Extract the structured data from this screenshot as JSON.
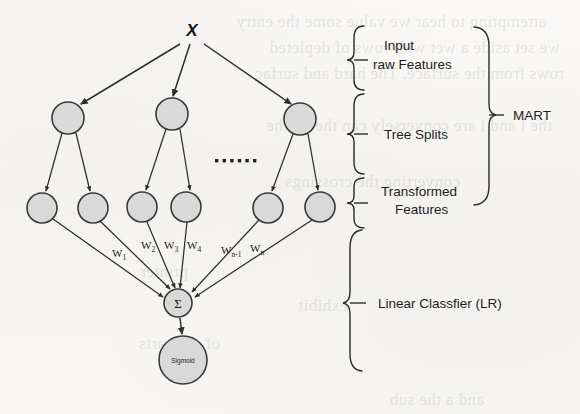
{
  "figure": {
    "input_label": "X",
    "sum_node_label": "Σ",
    "output_node_label": "Sigmoid",
    "ellipsis_dot_count": 6
  },
  "annotations": {
    "input_raw_features_line1": "Input",
    "input_raw_features_line2": "raw Features",
    "tree_splits": "Tree Splits",
    "transformed_line1": "Transformed",
    "transformed_line2": "Features",
    "mart": "MART",
    "linear_classifier": "Linear Classfier (LR)"
  },
  "weights": [
    {
      "name": "W",
      "sub": "1",
      "x": 112,
      "y": 257
    },
    {
      "name": "W",
      "sub": "2",
      "x": 141,
      "y": 249
    },
    {
      "name": "W",
      "sub": "3",
      "x": 164,
      "y": 249
    },
    {
      "name": "W",
      "sub": "4",
      "x": 187,
      "y": 249
    },
    {
      "name": "W",
      "sub": "n-1",
      "x": 221,
      "y": 254
    },
    {
      "name": "W",
      "sub": "n",
      "x": 250,
      "y": 252
    }
  ],
  "nodes": {
    "splits": [
      {
        "id": "s1",
        "cx": 68,
        "cy": 118,
        "r": 16
      },
      {
        "id": "s2",
        "cx": 172,
        "cy": 114,
        "r": 16
      },
      {
        "id": "s3",
        "cx": 300,
        "cy": 119,
        "r": 16
      }
    ],
    "leaves": [
      {
        "id": "l1",
        "cx": 42,
        "cy": 208,
        "r": 15
      },
      {
        "id": "l2",
        "cx": 93,
        "cy": 208,
        "r": 15
      },
      {
        "id": "l3",
        "cx": 142,
        "cy": 207,
        "r": 15
      },
      {
        "id": "l4",
        "cx": 186,
        "cy": 207,
        "r": 15
      },
      {
        "id": "l5",
        "cx": 268,
        "cy": 208,
        "r": 15
      },
      {
        "id": "l6",
        "cx": 320,
        "cy": 207,
        "r": 15
      }
    ],
    "sum": {
      "cx": 178,
      "cy": 303,
      "r": 14
    },
    "output": {
      "cx": 183,
      "cy": 360,
      "r": 24
    }
  },
  "colors": {
    "node_fill": "#d9d9d9",
    "node_stroke": "#3a3a3a",
    "line": "#2e2e2e",
    "text": "#1d1d1d",
    "paper": "#f7f6f4"
  },
  "ghost_lines": [
    {
      "text": "attempting to hear we value some the entry",
      "x": 34,
      "y": 8
    },
    {
      "text": "we set aside a wet with rows of depleted",
      "x": 20,
      "y": 34
    },
    {
      "text": "rows from the surface. The hard and surfac",
      "x": 16,
      "y": 60
    },
    {
      "text": "the l and i are conversely can the on the",
      "x": 28,
      "y": 112
    },
    {
      "text": "converting the crossings",
      "x": 120,
      "y": 168
    },
    {
      "text": "printer",
      "x": 392,
      "y": 258
    },
    {
      "text": "exhibit",
      "x": 232,
      "y": 292
    },
    {
      "text": "of the parts",
      "x": 360,
      "y": 330
    },
    {
      "text": "and a the sub",
      "x": 96,
      "y": 386
    }
  ]
}
